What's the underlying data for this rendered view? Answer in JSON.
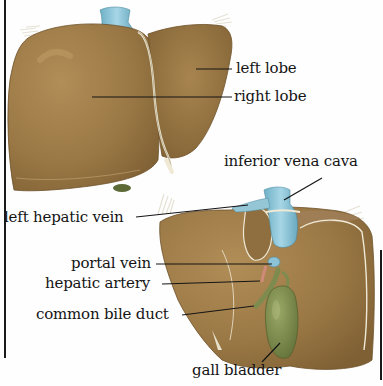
{
  "diagram": {
    "views": [
      {
        "name": "anterior view",
        "position": "top-left"
      },
      {
        "name": "posterior/inferior view",
        "position": "bottom-right"
      }
    ],
    "colors": {
      "liver": "#9c7a47",
      "liver_dark": "#7e5f33",
      "liver_highlight": "#b8935c",
      "vein_blue": "#8cc3d6",
      "gall_bladder": "#7d8c4e",
      "ligament": "#ece6d2",
      "artery_red": "#d08a7a",
      "text": "#151515"
    },
    "labels": [
      {
        "id": "left-lobe",
        "text": "left lobe"
      },
      {
        "id": "right-lobe",
        "text": "right lobe"
      },
      {
        "id": "inferior-vena-cava",
        "text": "inferior vena cava"
      },
      {
        "id": "left-hepatic-vein",
        "text": "left hepatic vein"
      },
      {
        "id": "portal-vein",
        "text": "portal vein"
      },
      {
        "id": "hepatic-artery",
        "text": "hepatic artery"
      },
      {
        "id": "common-bile-duct",
        "text": "common bile duct"
      },
      {
        "id": "gall-bladder",
        "text": "gall bladder"
      }
    ]
  }
}
